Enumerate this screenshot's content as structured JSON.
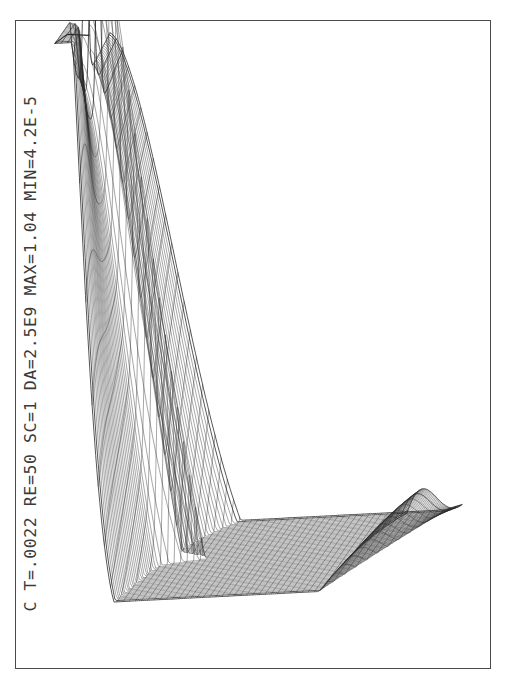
{
  "figure": {
    "caption": "C T=.0022 RE=50 SC=1 DA=2.5E9 MAX=1.04 MIN=4.2E-5",
    "faint_bottom_text": "",
    "frame_color": "#4a4a4a",
    "mesh_color": "#2b2b2b",
    "background_color": "#ffffff"
  },
  "chart_data": {
    "type": "surface",
    "title": "C T=.0022 RE=50 SC=1 DA=2.5E9 MAX=1.04 MIN=4.2E-5",
    "subtitle": "",
    "xlabel": "",
    "ylabel": "",
    "zlabel": "C",
    "grid": false,
    "legend": "none",
    "projection": "wireframe-mesh-3d",
    "variable": "C",
    "parameters": {
      "T": 0.0022,
      "RE": 50,
      "SC": 1,
      "DA": 2500000000.0,
      "MAX": 1.04,
      "MIN": 4.2e-05
    },
    "parameter_labels": [
      "T=.0022",
      "RE=50",
      "SC=1",
      "DA=2.5E9",
      "MAX=1.04",
      "MIN=4.2E-5"
    ],
    "zlim": [
      4.2e-05,
      1.04
    ],
    "mesh": {
      "u_lines": 58,
      "v_lines": 60,
      "description": "Dense rectangular wireframe mesh of a concentration field rendered in oblique 3D projection. A tall ridge rises along the left/front edge to a sharp apex near the top-left, falls away into a broad saddle valley across the centre, and flattens out toward the right/back edge. A narrow tongue-shaped plume with a rounded tip protrudes toward the centre of the domain."
    },
    "features": [
      {
        "name": "apex-peak",
        "x": 0.29,
        "y": 0.02,
        "value": 1.04
      },
      {
        "name": "ridge-crest",
        "x": 0.14,
        "y": 0.55,
        "value": 0.95
      },
      {
        "name": "saddle-valley",
        "x": 0.5,
        "y": 0.45,
        "value": 0.35
      },
      {
        "name": "plume-tip",
        "x": 0.45,
        "y": 0.43,
        "value": 0.62
      },
      {
        "name": "flat-plateau",
        "x": 0.82,
        "y": 0.3,
        "value": 4e-05
      }
    ]
  }
}
